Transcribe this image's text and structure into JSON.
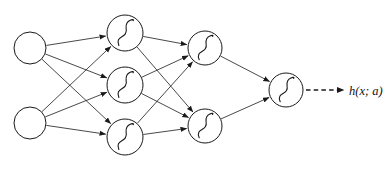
{
  "diagram": {
    "kind": "neural-network",
    "background_color": "#ffffff",
    "line_color": "#1a1a1a",
    "output_label": "h(x; a)",
    "layers": [
      {
        "id": "input",
        "name": "input-layer",
        "node_style": "empty-circle",
        "nodes": [
          {
            "id": "i1",
            "cx": 30,
            "cy": 48,
            "r": 16,
            "glyph": ""
          },
          {
            "id": "i2",
            "cx": 30,
            "cy": 123,
            "r": 16,
            "glyph": ""
          }
        ]
      },
      {
        "id": "hidden1",
        "name": "hidden-layer-1",
        "node_style": "sigmoid-circle",
        "nodes": [
          {
            "id": "h1",
            "cx": 125,
            "cy": 33,
            "r": 18,
            "glyph": "sigmoid"
          },
          {
            "id": "h2",
            "cx": 125,
            "cy": 85,
            "r": 18,
            "glyph": "sigmoid"
          },
          {
            "id": "h3",
            "cx": 125,
            "cy": 137,
            "r": 18,
            "glyph": "sigmoid"
          }
        ]
      },
      {
        "id": "hidden2",
        "name": "hidden-layer-2",
        "node_style": "sigmoid-circle",
        "nodes": [
          {
            "id": "g1",
            "cx": 205,
            "cy": 48,
            "r": 17,
            "glyph": "sigmoid"
          },
          {
            "id": "g2",
            "cx": 205,
            "cy": 126,
            "r": 17,
            "glyph": "sigmoid"
          }
        ]
      },
      {
        "id": "output",
        "name": "output-layer",
        "node_style": "sigmoid-circle",
        "nodes": [
          {
            "id": "o1",
            "cx": 286,
            "cy": 90,
            "r": 17,
            "glyph": "sigmoid"
          }
        ]
      }
    ],
    "edges": [
      {
        "from": "i1",
        "to": "h1"
      },
      {
        "from": "i1",
        "to": "h2"
      },
      {
        "from": "i1",
        "to": "h3"
      },
      {
        "from": "i2",
        "to": "h1"
      },
      {
        "from": "i2",
        "to": "h2"
      },
      {
        "from": "i2",
        "to": "h3"
      },
      {
        "from": "h1",
        "to": "g1"
      },
      {
        "from": "h1",
        "to": "g2"
      },
      {
        "from": "h2",
        "to": "g1"
      },
      {
        "from": "h2",
        "to": "g2"
      },
      {
        "from": "h3",
        "to": "g1"
      },
      {
        "from": "h3",
        "to": "g2"
      },
      {
        "from": "g1",
        "to": "o1"
      },
      {
        "from": "g2",
        "to": "o1"
      }
    ],
    "output_arrow": {
      "x1": 306,
      "y1": 90,
      "x2": 344,
      "y2": 90,
      "style": "dashed",
      "label_x": 349,
      "label_y": 95
    }
  }
}
